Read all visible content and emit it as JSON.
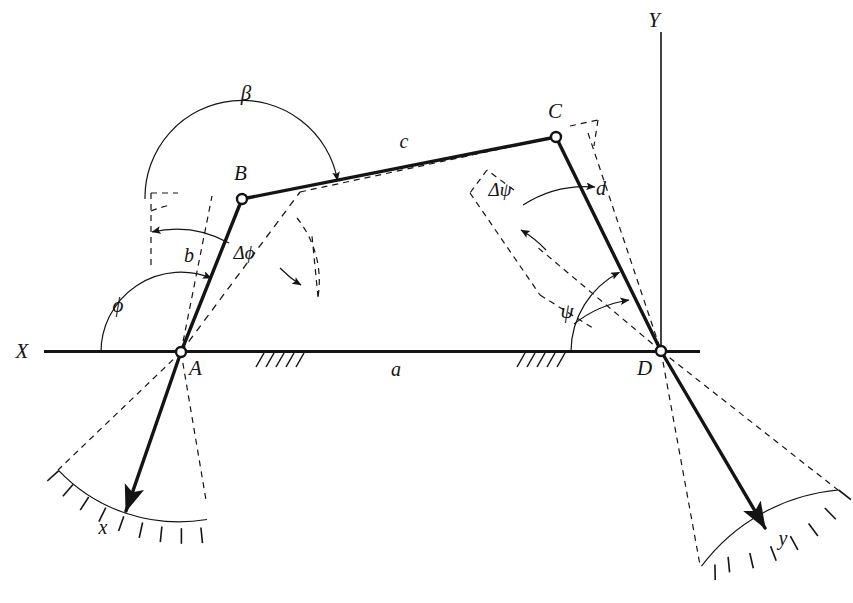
{
  "figure": {
    "type": "kinematic-diagram",
    "background_color": "#ffffff",
    "ink_color": "#141414"
  },
  "axes": {
    "x": {
      "label": "X",
      "label_x": 22,
      "label_y": 358,
      "line_x1": 44,
      "line_y1": 351,
      "line_x2": 700,
      "line_y2": 351
    },
    "y": {
      "label": "Y",
      "label_x": 654,
      "label_y": 27,
      "line_x1": 661,
      "line_y1": 32,
      "line_x2": 661,
      "line_y2": 351
    }
  },
  "joints": [
    {
      "id": "A",
      "label": "A",
      "x": 181,
      "y": 352,
      "label_x": 189,
      "label_y": 375,
      "r": 5.0
    },
    {
      "id": "B",
      "label": "B",
      "x": 242,
      "y": 199,
      "label_x": 234,
      "label_y": 180,
      "r": 5.0
    },
    {
      "id": "C",
      "label": "C",
      "x": 556,
      "y": 137,
      "label_x": 548,
      "label_y": 118,
      "r": 5.0
    },
    {
      "id": "D",
      "label": "D",
      "x": 661,
      "y": 351,
      "label_x": 637,
      "label_y": 375,
      "r": 5.0
    }
  ],
  "links": [
    {
      "id": "a",
      "label": "a",
      "name": "ground-link",
      "from": "A",
      "to": "D",
      "label_x": 396,
      "label_y": 376
    },
    {
      "id": "b",
      "label": "b",
      "name": "input-crank",
      "from": "A",
      "to": "B",
      "label_x": 189,
      "label_y": 262
    },
    {
      "id": "c",
      "label": "c",
      "name": "coupler-link",
      "from": "B",
      "to": "C",
      "label_x": 404,
      "label_y": 148
    },
    {
      "id": "d",
      "label": "d",
      "name": "output-crank",
      "from": "C",
      "to": "D",
      "label_x": 601,
      "label_y": 195
    }
  ],
  "angles": [
    {
      "id": "phi",
      "label": "ϕ",
      "name": "input-angle-phi",
      "vertex": "A",
      "label_x": 118,
      "label_y": 312
    },
    {
      "id": "beta",
      "label": "β",
      "name": "transmission-angle-beta",
      "vertex": "B",
      "label_x": 246,
      "label_y": 100
    },
    {
      "id": "psi",
      "label": "ψ",
      "name": "output-angle-psi",
      "vertex": "D",
      "label_x": 567,
      "label_y": 318
    },
    {
      "id": "dphi",
      "label": "Δϕ",
      "name": "input-increment-delta-phi",
      "vertex": "A",
      "label_x": 244,
      "label_y": 259
    },
    {
      "id": "dpsi",
      "label": "Δψ",
      "name": "output-increment-delta-psi",
      "vertex": "C",
      "label_x": 500,
      "label_y": 196
    }
  ],
  "scales": [
    {
      "id": "x-scale",
      "label": "x",
      "name": "input-angle-scale-x",
      "label_x": 103,
      "label_y": 534,
      "center": "A",
      "radius": 166,
      "pointer_angle_deg": 251,
      "tick_count": 11
    },
    {
      "id": "y-scale",
      "label": "y",
      "name": "output-angle-scale-y",
      "label_x": 783,
      "label_y": 545,
      "center": "D",
      "radius": 192,
      "pointer_angle_deg": 287,
      "tick_count": 11
    }
  ],
  "ground_supports": [
    {
      "id": "support-left",
      "name": "ground-hatch-left",
      "x": 258,
      "y": 352,
      "width": 44
    },
    {
      "id": "support-right",
      "name": "ground-hatch-right",
      "x": 519,
      "y": 352,
      "width": 44
    }
  ]
}
